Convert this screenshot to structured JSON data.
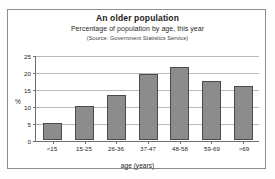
{
  "chart_data": {
    "type": "bar",
    "title": "An older population",
    "subtitle": "Percentage of population by age, this year",
    "source": "(Source: Government Statistics Service)",
    "categories": [
      "<15",
      "15-25",
      "26-36",
      "37-47",
      "48-58",
      "59-69",
      ">69"
    ],
    "values": [
      5,
      10,
      13.3,
      19.5,
      21.5,
      17.5,
      15.8
    ],
    "xlabel": "age (years)",
    "ylabel": "%",
    "ylim": [
      0,
      25
    ],
    "ytick_labels": [
      "25",
      "20",
      "15",
      "10",
      "5",
      "0"
    ],
    "ytick_values": [
      25,
      20,
      15,
      10,
      5,
      0
    ],
    "grid": true,
    "legend": "none",
    "bar_color": "#8c8c8c",
    "bar_border_color": "#4a4a4a",
    "axis_color": "#6e6e6e",
    "grid_color": "#b9b9b9",
    "plot_background": "#ffffff",
    "frame_border_color": "#8d8d8d"
  }
}
